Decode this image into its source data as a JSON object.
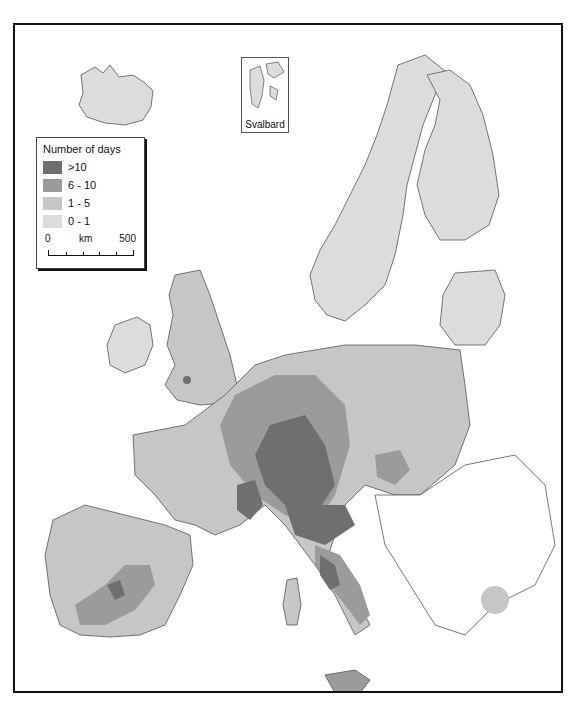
{
  "map": {
    "title": "Number of days",
    "inset_label": "Svalbard",
    "legend": {
      "title": "Number of days",
      "classes": [
        {
          "label": ">10",
          "color": "#6f6f6f"
        },
        {
          "label": "6 - 10",
          "color": "#9b9b9b"
        },
        {
          "label": "1 - 5",
          "color": "#c6c6c6"
        },
        {
          "label": "0 - 1",
          "color": "#dcdcdc"
        }
      ]
    },
    "scale_bar": {
      "start": "0",
      "unit": "km",
      "end": "500"
    },
    "colors": {
      "no_data": "#ffffff",
      "border": "#555555",
      "frame": "#111111"
    }
  }
}
